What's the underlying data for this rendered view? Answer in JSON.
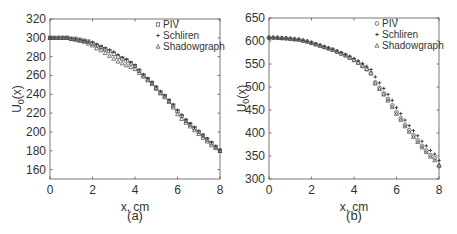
{
  "chart_data": [
    {
      "id": "a",
      "type": "scatter",
      "caption": "(a)",
      "title": "",
      "xlabel": "x, cm",
      "ylabel": "U0(x)",
      "ylabel_main": "U",
      "ylabel_sub": "0",
      "ylabel_rest": "(x)",
      "xlim": [
        0,
        8
      ],
      "ylim": [
        150,
        320
      ],
      "xticks": [
        0,
        2,
        4,
        6,
        8
      ],
      "yticks": [
        160,
        180,
        200,
        220,
        240,
        260,
        280,
        300,
        320
      ],
      "grid": false,
      "legend_position": "upper right",
      "legend": [
        {
          "label": "PIV",
          "marker": "square"
        },
        {
          "label": "Schliren",
          "marker": "plus"
        },
        {
          "label": "Shadowgraph",
          "marker": "triangle"
        }
      ],
      "x": [
        0,
        0.2,
        0.4,
        0.6,
        0.8,
        1.0,
        1.2,
        1.4,
        1.6,
        1.8,
        2.0,
        2.2,
        2.4,
        2.6,
        2.8,
        3.0,
        3.2,
        3.4,
        3.6,
        3.8,
        4.0,
        4.2,
        4.4,
        4.6,
        4.8,
        5.0,
        5.2,
        5.4,
        5.6,
        5.8,
        6.0,
        6.2,
        6.4,
        6.6,
        6.8,
        7.0,
        7.2,
        7.4,
        7.6,
        7.8,
        8.0
      ],
      "series": [
        {
          "name": "PIV",
          "values": [
            300,
            300,
            300,
            300,
            300,
            299,
            299,
            298,
            297,
            296,
            294,
            292,
            290,
            288,
            286,
            283,
            280,
            278,
            276,
            273,
            270,
            265,
            260,
            256,
            252,
            247,
            242,
            238,
            233,
            228,
            222,
            217,
            212,
            208,
            204,
            200,
            196,
            192,
            188,
            184,
            180
          ]
        },
        {
          "name": "Schliren",
          "values": [
            300,
            300,
            300,
            300,
            300,
            299,
            299,
            298,
            297,
            296,
            295,
            293,
            291,
            289,
            287,
            285,
            282,
            279,
            277,
            274,
            271,
            266,
            261,
            257,
            253,
            248,
            243,
            239,
            234,
            229,
            223,
            218,
            213,
            209,
            205,
            201,
            197,
            193,
            189,
            185,
            181
          ]
        },
        {
          "name": "Shadowgraph",
          "values": [
            300,
            300,
            300,
            300,
            300,
            299,
            298,
            297,
            296,
            294,
            292,
            289,
            287,
            284,
            281,
            278,
            275,
            273,
            271,
            269,
            267,
            263,
            259,
            255,
            251,
            246,
            241,
            237,
            232,
            226,
            219,
            214,
            210,
            206,
            202,
            198,
            194,
            190,
            186,
            183,
            180
          ]
        }
      ]
    },
    {
      "id": "b",
      "type": "scatter",
      "caption": "(b)",
      "title": "",
      "xlabel": "x, cm",
      "ylabel": "U0(x)",
      "ylabel_main": "U",
      "ylabel_sub": "0",
      "ylabel_rest": "(x)",
      "xlim": [
        0,
        8
      ],
      "ylim": [
        300,
        650
      ],
      "xticks": [
        0,
        2,
        4,
        6,
        8
      ],
      "yticks": [
        300,
        350,
        400,
        450,
        500,
        550,
        600,
        650
      ],
      "grid": false,
      "legend_position": "upper right",
      "legend": [
        {
          "label": "PIV",
          "marker": "circle"
        },
        {
          "label": "Schliren",
          "marker": "plus"
        },
        {
          "label": "Shadowgraph",
          "marker": "triangle"
        }
      ],
      "x": [
        0,
        0.2,
        0.4,
        0.6,
        0.8,
        1.0,
        1.2,
        1.4,
        1.6,
        1.8,
        2.0,
        2.2,
        2.4,
        2.6,
        2.8,
        3.0,
        3.2,
        3.4,
        3.6,
        3.8,
        4.0,
        4.2,
        4.4,
        4.6,
        4.8,
        5.0,
        5.2,
        5.4,
        5.6,
        5.8,
        6.0,
        6.2,
        6.4,
        6.6,
        6.8,
        7.0,
        7.2,
        7.4,
        7.6,
        7.8,
        8.0
      ],
      "series": [
        {
          "name": "PIV",
          "values": [
            607,
            607,
            607,
            606,
            606,
            605,
            604,
            603,
            601,
            599,
            596,
            593,
            590,
            587,
            584,
            581,
            577,
            573,
            569,
            564,
            559,
            553,
            546,
            539,
            530,
            510,
            498,
            486,
            474,
            460,
            445,
            432,
            418,
            406,
            395,
            384,
            372,
            362,
            352,
            345,
            328
          ]
        },
        {
          "name": "Schliren",
          "values": [
            607,
            607,
            607,
            606,
            606,
            605,
            604,
            603,
            601,
            599,
            597,
            594,
            591,
            588,
            585,
            582,
            578,
            575,
            571,
            567,
            562,
            557,
            551,
            545,
            538,
            522,
            509,
            497,
            484,
            471,
            455,
            442,
            428,
            416,
            405,
            394,
            382,
            372,
            362,
            354,
            340
          ]
        },
        {
          "name": "Shadowgraph",
          "values": [
            608,
            608,
            607,
            607,
            606,
            605,
            604,
            603,
            601,
            599,
            596,
            593,
            590,
            587,
            584,
            581,
            577,
            573,
            569,
            564,
            559,
            553,
            546,
            539,
            530,
            508,
            496,
            484,
            471,
            457,
            442,
            429,
            415,
            403,
            392,
            381,
            369,
            359,
            349,
            341,
            330
          ]
        }
      ]
    }
  ]
}
